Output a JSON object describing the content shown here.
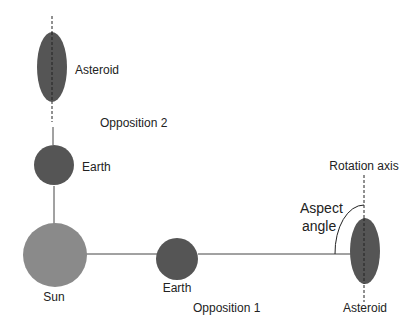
{
  "diagram": {
    "colors": {
      "body_dark": "#555555",
      "sun": "#8a8a8a",
      "line": "#444444",
      "text": "#222222"
    },
    "nodes": [
      {
        "id": "sun",
        "label": "Sun",
        "shape": "circle"
      },
      {
        "id": "earth1",
        "label": "Earth",
        "shape": "circle"
      },
      {
        "id": "earth2",
        "label": "Earth",
        "shape": "circle"
      },
      {
        "id": "asteroid1",
        "label": "Asteroid",
        "shape": "ellipse"
      },
      {
        "id": "asteroid2",
        "label": "Asteroid",
        "shape": "ellipse"
      }
    ],
    "edges": [
      {
        "from": "sun",
        "to": "earth1"
      },
      {
        "from": "earth1",
        "to": "asteroid1"
      },
      {
        "from": "sun",
        "to": "earth2"
      },
      {
        "from": "earth2",
        "to": "asteroid2"
      }
    ],
    "labels": {
      "sun": "Sun",
      "earth_opp1": "Earth",
      "earth_opp2": "Earth",
      "asteroid_opp1": "Asteroid",
      "asteroid_opp2": "Asteroid",
      "opposition1": "Opposition 1",
      "opposition2": "Opposition 2",
      "rotation_axis": "Rotation axis",
      "aspect_line1": "Aspect",
      "aspect_line2": "angle"
    }
  }
}
